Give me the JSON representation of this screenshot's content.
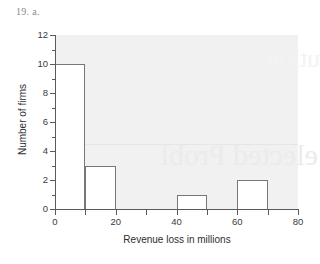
{
  "problem_label": "19. a.",
  "watermark": {
    "line_main": "elected Probl",
    "line_faint": "ution"
  },
  "chart_data": {
    "type": "bar",
    "title": "",
    "subtitle": "",
    "xlabel": "Revenue loss in millions",
    "ylabel": "Number of firms",
    "xlim": [
      0,
      80
    ],
    "ylim": [
      0,
      12
    ],
    "grid": false,
    "legend": "none",
    "bin_width": 10,
    "x_major_ticks": [
      0,
      20,
      40,
      60,
      80
    ],
    "x_major_tick_labels": [
      "0",
      "20",
      "40",
      "60",
      "80"
    ],
    "x_minor_ticks": [
      10,
      30,
      50,
      70
    ],
    "y_major_ticks": [
      0,
      2,
      4,
      6,
      8,
      10,
      12
    ],
    "y_major_tick_labels": [
      "0",
      "2",
      "4",
      "6",
      "8",
      "10",
      "12"
    ],
    "y_minor_ticks": [
      1,
      3,
      5,
      7,
      9,
      11
    ],
    "bin_edges": [
      0,
      10,
      20,
      30,
      40,
      50,
      60,
      70,
      80
    ],
    "categories": [
      "0-10",
      "10-20",
      "20-30",
      "30-40",
      "40-50",
      "50-60",
      "60-70",
      "70-80"
    ],
    "values": [
      10,
      3,
      0,
      0,
      1,
      0,
      2,
      0
    ],
    "bar_face_color": "#ffffff",
    "bar_edge_color": "#777777",
    "plot_background": "#f1f1f1"
  }
}
